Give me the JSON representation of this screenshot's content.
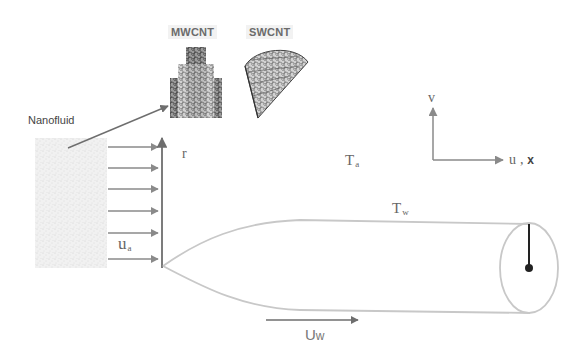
{
  "figure": {
    "nanotubes": {
      "mwcnt_label": "MWCNT",
      "swcnt_label": "SWCNT"
    },
    "nanofluid_label": "Nanofluid",
    "radial_axis_label": "r",
    "free_stream_velocity": {
      "symbol": "u",
      "subscript": "a"
    },
    "ambient_temperature": {
      "symbol": "T",
      "subscript": "a"
    },
    "wall_temperature": {
      "symbol": "T",
      "subscript": "w"
    },
    "wall_velocity": {
      "symbol": "U",
      "subscript": "w"
    },
    "coordinate_axes": {
      "vertical_label": "v",
      "horizontal_label_u": "u",
      "horizontal_sep": ",",
      "horizontal_label_x": "x"
    },
    "colors": {
      "arrow": "#8a8a8a",
      "axis": "#6e6e6e",
      "profile": "#c8c8c8",
      "radius_line": "#222222",
      "nanofluid_fill": "#ececec"
    }
  }
}
